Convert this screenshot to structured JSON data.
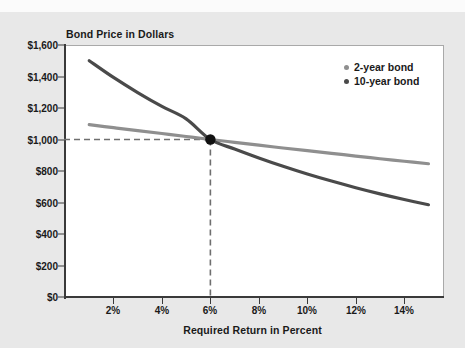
{
  "chart_data": {
    "type": "line",
    "title": "Bond Price in Dollars",
    "xlabel": "Required Return in Percent",
    "ylabel": "Bond Price in Dollars",
    "xlim": [
      0,
      15.6
    ],
    "ylim": [
      0,
      1600
    ],
    "grid": false,
    "legend_position": "top-right",
    "x_ticks": [
      "2%",
      "4%",
      "6%",
      "8%",
      "10%",
      "12%",
      "14%"
    ],
    "x_tick_values": [
      2,
      4,
      6,
      8,
      10,
      12,
      14
    ],
    "y_ticks": [
      "$0",
      "$200",
      "$400",
      "$600",
      "$800",
      "$1,000",
      "$1,200",
      "$1,400",
      "$1,600"
    ],
    "y_tick_values": [
      0,
      200,
      400,
      600,
      800,
      1000,
      1200,
      1400,
      1600
    ],
    "series": [
      {
        "name": "2-year bond",
        "color": "#8f8f8f",
        "x": [
          1,
          2,
          3,
          4,
          5,
          6,
          7,
          8,
          9,
          10,
          11,
          12,
          13,
          14,
          15
        ],
        "values": [
          1094,
          1075,
          1056,
          1038,
          1019,
          1000,
          982,
          964,
          946,
          929,
          912,
          895,
          878,
          862,
          846
        ]
      },
      {
        "name": "10-year bond",
        "color": "#4a4a4a",
        "x": [
          1,
          2,
          3,
          4,
          5,
          6,
          7,
          8,
          9,
          10,
          11,
          12,
          13,
          14,
          15
        ],
        "values": [
          1500,
          1394,
          1298,
          1210,
          1131,
          1000,
          940,
          883,
          830,
          781,
          736,
          694,
          655,
          619,
          586
        ]
      }
    ],
    "annotations": [
      {
        "type": "point",
        "name": "par-value-intersection",
        "x": 6,
        "y": 1000,
        "color": "#111111"
      },
      {
        "type": "dashed-line",
        "name": "horizontal-guide-1000",
        "orientation": "horizontal",
        "y": 1000,
        "x_from": 0,
        "x_to": 6,
        "color": "#6f6f6f"
      },
      {
        "type": "dashed-line",
        "name": "vertical-guide-6pct",
        "orientation": "vertical",
        "x": 6,
        "y_from": 0,
        "y_to": 1000,
        "color": "#6f6f6f"
      }
    ]
  },
  "legend": {
    "items": [
      {
        "label": "2-year bond",
        "color": "#8f8f8f"
      },
      {
        "label": "10-year bond",
        "color": "#4a4a4a"
      }
    ]
  },
  "colors": {
    "background": "#e8e8e8",
    "plot_background": "#ffffff",
    "axis": "#3a3a3a",
    "text": "#1a1a1a",
    "series_2_year": "#8f8f8f",
    "series_10_year": "#4a4a4a",
    "guide_dash": "#6f6f6f",
    "marker": "#111111"
  }
}
